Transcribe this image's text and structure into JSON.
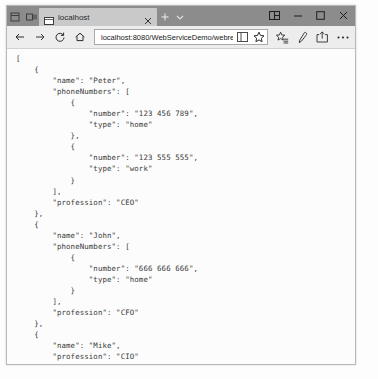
{
  "window": {
    "tab": {
      "title": "localhost",
      "favicon_icon": "page-icon",
      "close_icon": "close-icon"
    },
    "tabstrip_buttons": [
      {
        "name": "set-tabs-aside-icon",
        "label": ""
      },
      {
        "name": "tabs-you-set-aside-icon",
        "label": ""
      }
    ],
    "new_tab_icon": "plus-icon",
    "tab_menu_icon": "chevron-down-icon",
    "controls": [
      {
        "name": "split-screen-icon",
        "label": ""
      },
      {
        "name": "minimize-icon",
        "label": ""
      },
      {
        "name": "maximize-icon",
        "label": ""
      },
      {
        "name": "close-window-icon",
        "label": ""
      }
    ]
  },
  "toolbar": {
    "back_icon": "back-arrow-icon",
    "forward_icon": "forward-arrow-icon",
    "refresh_icon": "refresh-icon",
    "home_icon": "home-icon",
    "url_host": "localhost:8080",
    "url_path": "/WebServiceDemo/webresources/json",
    "url_full": "localhost:8080/WebServiceDemo/webresources/json",
    "url_placeholder": "Search or enter web address",
    "reading_view_icon": "reading-view-icon",
    "favorite_icon": "star-icon",
    "hub_icon": "favorites-hub-icon",
    "notes_icon": "web-notes-pen-icon",
    "share_icon": "share-icon",
    "more_icon": "more-ellipsis-icon"
  },
  "page": {
    "content_type": "json",
    "json_text": "[\n    {\n        \"name\": \"Peter\",\n        \"phoneNumbers\": [\n            {\n                \"number\": \"123 456 789\",\n                \"type\": \"home\"\n            },\n            {\n                \"number\": \"123 555 555\",\n                \"type\": \"work\"\n            }\n        ],\n        \"profession\": \"CEO\"\n    },\n    {\n        \"name\": \"John\",\n        \"phoneNumbers\": [\n            {\n                \"number\": \"666 666 666\",\n                \"type\": \"home\"\n            }\n        ],\n        \"profession\": \"CFO\"\n    },\n    {\n        \"name\": \"Mike\",\n        \"profession\": \"CIO\"\n    }\n]",
    "records": [
      {
        "name": "Peter",
        "profession": "CEO",
        "phoneNumbers": [
          {
            "number": "123 456 789",
            "type": "home"
          },
          {
            "number": "123 555 555",
            "type": "work"
          }
        ]
      },
      {
        "name": "John",
        "profession": "CFO",
        "phoneNumbers": [
          {
            "number": "666 666 666",
            "type": "home"
          }
        ]
      },
      {
        "name": "Mike",
        "profession": "CIO"
      }
    ]
  },
  "background_bleed": [
    "  = :  : . .  :  ..  :  .  . .  . :  ..",
    " .  .    .   .   ..   .  .  ..  . .  .",
    "  . . .  . .   . . .  .   .  . .  ."
  ]
}
